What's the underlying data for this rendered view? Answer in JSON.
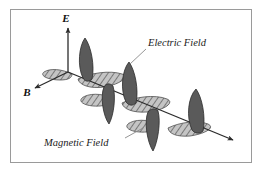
{
  "figure": {
    "type": "electromagnetic-wave-diagram",
    "title": "",
    "background_color": "#ffffff",
    "border_color": "#9a9a9a",
    "axes": [
      {
        "name": "electric-axis",
        "label": "E",
        "direction": "up",
        "arrow": true
      },
      {
        "name": "magnetic-axis",
        "label": "B",
        "direction": "down-left",
        "arrow": true
      },
      {
        "name": "propagation-axis",
        "label": "",
        "direction": "down-right",
        "arrow": true
      }
    ],
    "annotations": [
      {
        "name": "electric-field-annotation",
        "label": "Electric Field",
        "target": "dark-vertical-lobe",
        "leader_line": true
      },
      {
        "name": "magnetic-field-annotation",
        "label": "Magnetic Field",
        "target": "hatched-horizontal-lobe",
        "leader_line": true
      }
    ],
    "waves": [
      {
        "name": "electric-field-wave",
        "label": "Electric Field",
        "orientation": "vertical",
        "fill_color": "#5e5e5e",
        "stroke_color": "#2e2e2e",
        "pattern": "solid",
        "lobe_count": 5
      },
      {
        "name": "magnetic-field-wave",
        "label": "Magnetic Field",
        "orientation": "horizontal",
        "fill_color": "#b8b8b8",
        "stroke_color": "#4a4a4a",
        "pattern": "diagonal-hatch",
        "lobe_count": 5
      }
    ]
  },
  "colors": {
    "electric_fill": "#5e5e5e",
    "electric_stroke": "#2d2d2d",
    "magnetic_fill": "#bdbdbd",
    "magnetic_stroke": "#4f4f4f",
    "axis": "#333333",
    "leader": "#8a8a8a",
    "frame": "#9a9a9a",
    "text": "#141414"
  }
}
